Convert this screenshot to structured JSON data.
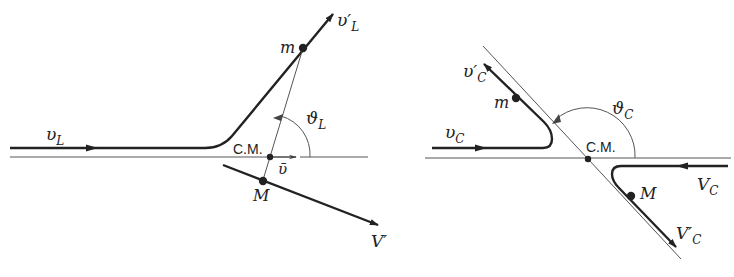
{
  "figure": {
    "colors": {
      "ink": "#222222",
      "thin": "#555555",
      "background": "#ffffff"
    }
  },
  "left_panel": {
    "frame": "laboratory",
    "labels": {
      "v_in": "υ",
      "v_in_sub": "L",
      "v_out": "υ′",
      "v_out_sub": "L",
      "m": "m",
      "M": "M",
      "V_out": "V′",
      "cm": "C.M.",
      "vbar": "ῡ",
      "theta": "ϑ",
      "theta_sub": "L"
    }
  },
  "right_panel": {
    "frame": "center-of-mass",
    "labels": {
      "v_in": "υ",
      "v_in_sub": "C",
      "v_out": "υ′",
      "v_out_sub": "C",
      "m": "m",
      "M": "M",
      "V_in": "V",
      "V_in_sub": "C",
      "V_out": "V′",
      "V_out_sub": "C",
      "cm": "C.M.",
      "theta": "ϑ",
      "theta_sub": "C"
    }
  }
}
